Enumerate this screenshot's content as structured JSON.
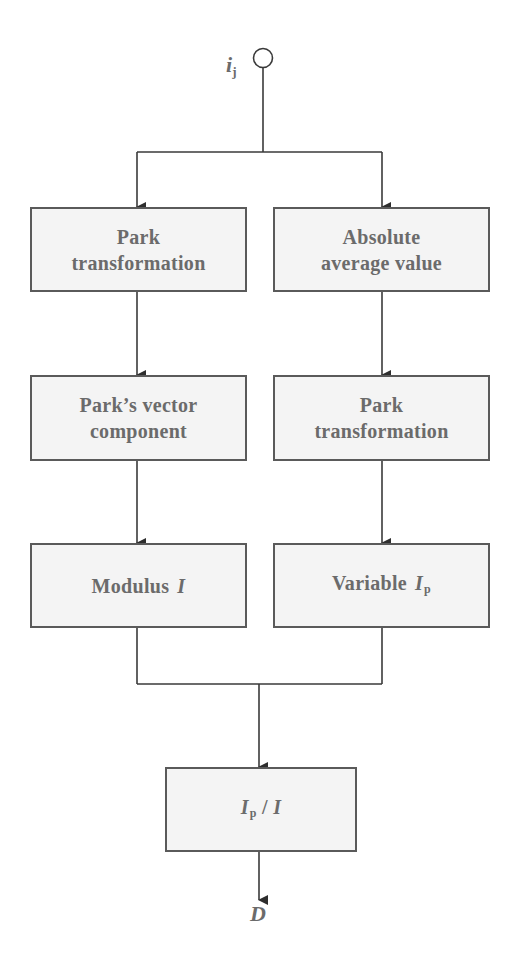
{
  "diagram": {
    "type": "flowchart",
    "colors": {
      "stroke": "#3a3a3a",
      "box_fill": "#f4f4f4",
      "box_border": "#5a5a5a",
      "text": "#6b6b6b"
    },
    "input": {
      "symbol": "i",
      "subscript": "j"
    },
    "left_column": {
      "box1": {
        "lines": [
          "Park",
          "transformation"
        ]
      },
      "box2": {
        "lines": [
          "Park’s vector",
          "component"
        ]
      },
      "box3": {
        "text": "Modulus",
        "symbol": "I",
        "subscript": ""
      }
    },
    "right_column": {
      "box1": {
        "lines": [
          "Absolute",
          "average value"
        ]
      },
      "box2": {
        "lines": [
          "Park",
          "transformation"
        ]
      },
      "box3": {
        "text": "Variable",
        "symbol": "I",
        "subscript": "p"
      }
    },
    "merge_box": {
      "numerator_symbol": "I",
      "numerator_subscript": "p",
      "operator": " / ",
      "denominator_symbol": "I"
    },
    "output": {
      "symbol": "D"
    },
    "edges": [
      {
        "from": "input",
        "to": "left_column.box1"
      },
      {
        "from": "input",
        "to": "right_column.box1"
      },
      {
        "from": "left_column.box1",
        "to": "left_column.box2"
      },
      {
        "from": "left_column.box2",
        "to": "left_column.box3"
      },
      {
        "from": "right_column.box1",
        "to": "right_column.box2"
      },
      {
        "from": "right_column.box2",
        "to": "right_column.box3"
      },
      {
        "from": "left_column.box3",
        "to": "merge_box"
      },
      {
        "from": "right_column.box3",
        "to": "merge_box"
      },
      {
        "from": "merge_box",
        "to": "output"
      }
    ]
  }
}
